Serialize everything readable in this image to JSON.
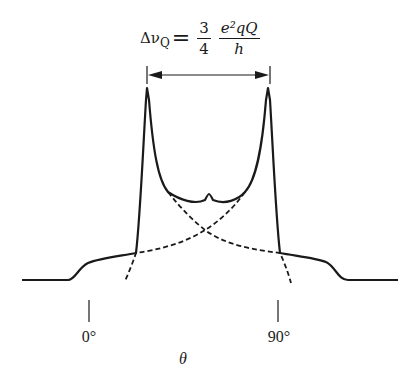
{
  "figure": {
    "formula": {
      "lhs_symbol": "Δν",
      "lhs_subscript": "Q",
      "equals": "=",
      "fraction1_numerator": "3",
      "fraction1_denominator": "4",
      "fraction2_numerator": "e²qQ",
      "fraction2_denominator": "h"
    },
    "axis": {
      "tick_labels": [
        "0°",
        "90°"
      ],
      "xlabel": "θ"
    },
    "curves": [
      {
        "name": "total-spectrum",
        "style": "solid"
      },
      {
        "name": "component-left",
        "style": "dashed"
      },
      {
        "name": "component-right",
        "style": "dashed"
      }
    ],
    "annotation": "double-headed arrow spanning the two peak singularities",
    "line_color": "#1a1a1a"
  }
}
